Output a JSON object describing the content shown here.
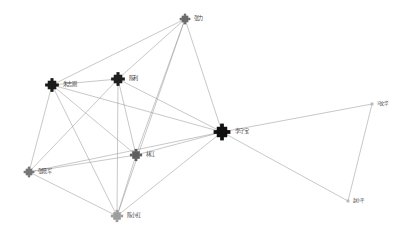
{
  "diagram": {
    "type": "node-link-network",
    "width": 404,
    "height": 244,
    "background": "#ffffff",
    "edge_color": "#9a9a9a",
    "label_color": "#3a3a3a"
  },
  "nodes": [
    {
      "id": "n-top",
      "label": "张力",
      "x": 185,
      "y": 19,
      "size": 7,
      "color": "#6b6b6b",
      "degree": 5
    },
    {
      "id": "n-upper-left",
      "label": "朱志刚",
      "x": 52,
      "y": 85,
      "size": 9,
      "color": "#1a1a1a",
      "degree": 7
    },
    {
      "id": "n-upper-mid",
      "label": "陈利",
      "x": 118,
      "y": 79,
      "size": 9,
      "color": "#1f1f1f",
      "degree": 7
    },
    {
      "id": "n-hub",
      "label": "李守宝",
      "x": 222,
      "y": 132,
      "size": 11,
      "color": "#101010",
      "degree": 9
    },
    {
      "id": "n-center",
      "label": "林江",
      "x": 136,
      "y": 155,
      "size": 8,
      "color": "#5e5e5e",
      "degree": 6
    },
    {
      "id": "n-left",
      "label": "张晓军",
      "x": 29,
      "y": 172,
      "size": 7,
      "color": "#757575",
      "degree": 6
    },
    {
      "id": "n-bottom",
      "label": "陈小红",
      "x": 117,
      "y": 216,
      "size": 8,
      "color": "#9d9d9d",
      "degree": 6
    },
    {
      "id": "n-right-top",
      "label": "马文华",
      "x": 372,
      "y": 104,
      "size": 3,
      "color": "#b8b8b8",
      "degree": 2
    },
    {
      "id": "n-right-bottom",
      "label": "赵小平",
      "x": 348,
      "y": 201,
      "size": 3,
      "color": "#b8b8b8",
      "degree": 2
    }
  ],
  "edges": [
    {
      "from": "n-top",
      "to": "n-upper-left"
    },
    {
      "from": "n-top",
      "to": "n-upper-mid"
    },
    {
      "from": "n-top",
      "to": "n-hub"
    },
    {
      "from": "n-top",
      "to": "n-center"
    },
    {
      "from": "n-top",
      "to": "n-bottom"
    },
    {
      "from": "n-upper-left",
      "to": "n-upper-mid"
    },
    {
      "from": "n-upper-left",
      "to": "n-hub"
    },
    {
      "from": "n-upper-left",
      "to": "n-center"
    },
    {
      "from": "n-upper-left",
      "to": "n-left"
    },
    {
      "from": "n-upper-left",
      "to": "n-bottom"
    },
    {
      "from": "n-upper-mid",
      "to": "n-hub"
    },
    {
      "from": "n-upper-mid",
      "to": "n-center"
    },
    {
      "from": "n-upper-mid",
      "to": "n-left"
    },
    {
      "from": "n-upper-mid",
      "to": "n-bottom"
    },
    {
      "from": "n-hub",
      "to": "n-center"
    },
    {
      "from": "n-hub",
      "to": "n-left"
    },
    {
      "from": "n-hub",
      "to": "n-bottom"
    },
    {
      "from": "n-hub",
      "to": "n-right-top"
    },
    {
      "from": "n-hub",
      "to": "n-right-bottom"
    },
    {
      "from": "n-center",
      "to": "n-left"
    },
    {
      "from": "n-center",
      "to": "n-bottom"
    },
    {
      "from": "n-left",
      "to": "n-bottom"
    },
    {
      "from": "n-right-top",
      "to": "n-right-bottom"
    }
  ]
}
